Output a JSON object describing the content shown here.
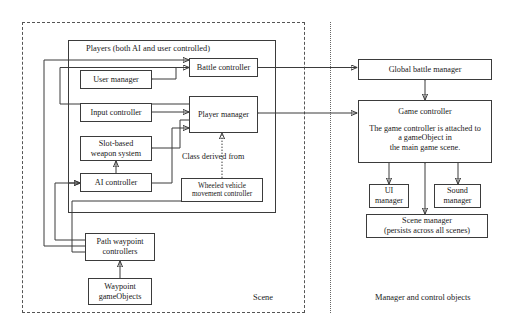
{
  "diagram": {
    "regions": {
      "scene": {
        "label": "Scene",
        "style": "dashed"
      },
      "managers": {
        "label": "Manager and control objects",
        "style": "dotted-separated"
      }
    },
    "groups": [
      {
        "id": "players",
        "label": "Players (both AI and user controlled)"
      }
    ],
    "annotations": [
      {
        "id": "class-derived-from",
        "label": "Class derived from"
      }
    ],
    "nodes": [
      {
        "id": "user-manager",
        "lines": [
          "User manager"
        ]
      },
      {
        "id": "input-controller",
        "lines": [
          "Input controller"
        ]
      },
      {
        "id": "slot-based-weapon-system",
        "lines": [
          "Slot-based",
          "weapon system"
        ]
      },
      {
        "id": "ai-controller",
        "lines": [
          "AI controller"
        ]
      },
      {
        "id": "battle-controller",
        "lines": [
          "Battle controller"
        ]
      },
      {
        "id": "player-manager",
        "lines": [
          "Player manager"
        ]
      },
      {
        "id": "wheeled-vehicle-movement-controller",
        "lines": [
          "Wheeled vehicle",
          "movement controller"
        ]
      },
      {
        "id": "path-waypoint-controllers",
        "lines": [
          "Path waypoint",
          "controllers"
        ]
      },
      {
        "id": "waypoint-gameobjects",
        "lines": [
          "Waypoint",
          "gameObjects"
        ]
      },
      {
        "id": "global-battle-manager",
        "lines": [
          "Global battle manager"
        ]
      },
      {
        "id": "game-controller",
        "lines": [
          "Game controller"
        ]
      },
      {
        "id": "game-controller-note",
        "lines": [
          "The game controller is attached to",
          "a gameObject in",
          "the main game scene."
        ]
      },
      {
        "id": "ui-manager",
        "lines": [
          "UI",
          "manager"
        ]
      },
      {
        "id": "sound-manager",
        "lines": [
          "Sound",
          "manager"
        ]
      },
      {
        "id": "scene-manager",
        "lines": [
          "Scene manager",
          "(persists across all scenes)"
        ]
      }
    ],
    "colors": {
      "stroke": "#3b3b3b",
      "text": "#1a1a1a",
      "background": "#ffffff",
      "dashed_border": "#555555",
      "dotted_divider": "#666666"
    }
  }
}
